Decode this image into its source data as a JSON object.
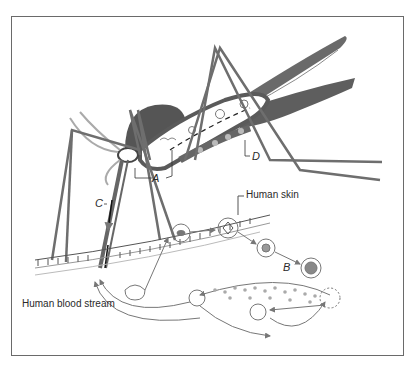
{
  "diagram": {
    "labels": {
      "human_skin": "Human skin",
      "human_blood_stream": "Human blood stream",
      "A": "A",
      "B": "B",
      "C": "C",
      "D": "D"
    },
    "colors": {
      "mosquito_body": "#5a5a5a",
      "legs": "#6e6e6e",
      "ink": "#2a2a2a",
      "frame": "#6a6a6a",
      "arrows": "#777777"
    },
    "icons": [
      "mosquito-illustration",
      "skin-layer",
      "parasite-cell",
      "arrow-cycle"
    ]
  }
}
